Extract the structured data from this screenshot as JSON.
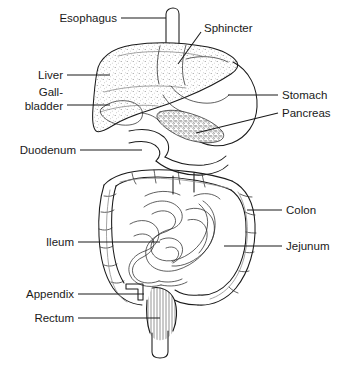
{
  "figure": {
    "background_color": "#ffffff",
    "line_color": "#1a1a1a",
    "label_color": "#1a1a1a",
    "width": 355,
    "height": 365,
    "caption": ""
  },
  "labels": {
    "esophagus": "Esophagus",
    "sphincter": "Sphincter",
    "liver": "Liver",
    "gallbladder_line1": "Gall-",
    "gallbladder_line2": "bladder",
    "duodenum": "Duodenum",
    "ileum": "Ileum",
    "appendix": "Appendix",
    "rectum": "Rectum",
    "stomach": "Stomach",
    "pancreas": "Pancreas",
    "colon": "Colon",
    "jejunum": "Jejunum"
  },
  "organs": [
    {
      "name": "esophagus",
      "label": "Esophagus",
      "side": "left"
    },
    {
      "name": "sphincter",
      "label": "Sphincter",
      "side": "right"
    },
    {
      "name": "liver",
      "label": "Liver",
      "side": "left",
      "texture": "stipple"
    },
    {
      "name": "gallbladder",
      "label": "Gall-bladder",
      "side": "left"
    },
    {
      "name": "duodenum",
      "label": "Duodenum",
      "side": "left"
    },
    {
      "name": "ileum",
      "label": "Ileum",
      "side": "left"
    },
    {
      "name": "appendix",
      "label": "Appendix",
      "side": "left"
    },
    {
      "name": "rectum",
      "label": "Rectum",
      "side": "left",
      "texture": "hatch"
    },
    {
      "name": "stomach",
      "label": "Stomach",
      "side": "right"
    },
    {
      "name": "pancreas",
      "label": "Pancreas",
      "side": "right",
      "texture": "granular"
    },
    {
      "name": "colon",
      "label": "Colon",
      "side": "right"
    },
    {
      "name": "jejunum",
      "label": "Jejunum",
      "side": "right"
    }
  ]
}
